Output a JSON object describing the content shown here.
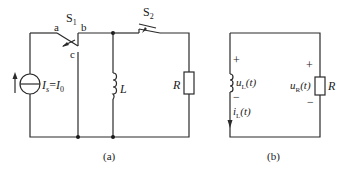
{
  "figure_a": {
    "caption": "(a)",
    "source_label": "I",
    "source_sub": "s",
    "source_eq": "=",
    "source_value": "I",
    "source_value_sub": "0",
    "switch1": {
      "label": "S",
      "sub": "1",
      "node_a": "a",
      "node_b": "b",
      "node_c": "c"
    },
    "switch2": {
      "label": "S",
      "sub": "2"
    },
    "inductor_label": "L",
    "resistor_label": "R"
  },
  "figure_b": {
    "caption": "(b)",
    "inductor_voltage": {
      "sym": "u",
      "sub": "L",
      "arg": "(t)",
      "plus": "+",
      "minus": "−"
    },
    "inductor_current": {
      "sym": "i",
      "sub": "L",
      "arg": "(t)"
    },
    "resistor_voltage": {
      "sym": "u",
      "sub": "R",
      "arg": "(t)",
      "plus": "+",
      "minus": "−"
    },
    "resistor_label": "R"
  }
}
